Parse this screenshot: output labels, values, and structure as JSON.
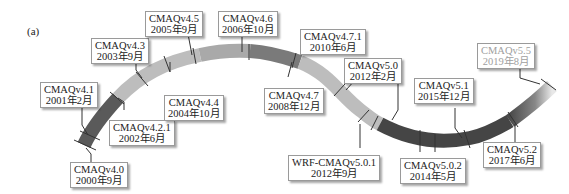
{
  "figure": {
    "panel_label": "(a)",
    "ribbon_colors": {
      "segment_dark": "#5a5a5a",
      "segment_mid": "#8c8c8c",
      "segment_light": "#bdbdbd",
      "segment_darkest": "#3e3e3e"
    },
    "milestones": [
      {
        "version": "CMAQv4.0",
        "date": "2000年9月"
      },
      {
        "version": "CMAQv4.1",
        "date": "2001年2月"
      },
      {
        "version": "CMAQv4.2.1",
        "date": "2002年6月"
      },
      {
        "version": "CMAQv4.3",
        "date": "2003年9月"
      },
      {
        "version": "CMAQv4.4",
        "date": "2004年10月"
      },
      {
        "version": "CMAQv4.5",
        "date": "2005年9月"
      },
      {
        "version": "CMAQv4.6",
        "date": "2006年10月"
      },
      {
        "version": "CMAQv4.7",
        "date": "2008年12月"
      },
      {
        "version": "CMAQv4.7.1",
        "date": "2010年6月"
      },
      {
        "version": "CMAQv5.0",
        "date": "2012年2月"
      },
      {
        "version": "WRF-CMAQv5.0.1",
        "date": "2012年9月"
      },
      {
        "version": "CMAQv5.0.2",
        "date": "2014年5月"
      },
      {
        "version": "CMAQv5.1",
        "date": "2015年12月"
      },
      {
        "version": "CMAQv5.2",
        "date": "2017年6月"
      },
      {
        "version": "CMAQv5.5",
        "date": "2019年8月"
      }
    ]
  }
}
